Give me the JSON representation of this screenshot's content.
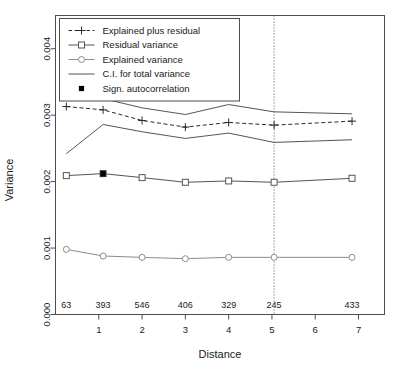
{
  "chart_data": {
    "type": "line",
    "title": "",
    "xlabel": "Distance",
    "ylabel": "Variance",
    "xlim": [
      0,
      7.6
    ],
    "ylim": [
      0.0,
      0.0045
    ],
    "grid": false,
    "legend_position": "top-left",
    "x": [
      0.25,
      1.1,
      2.0,
      3.0,
      4.0,
      5.05,
      6.85
    ],
    "xtick_labels": [
      "1",
      "2",
      "3",
      "4",
      "5",
      "6",
      "7"
    ],
    "xtick_values": [
      1,
      2,
      3,
      4,
      5,
      6,
      7
    ],
    "ytick_labels": [
      "0.000",
      "0.001",
      "0.002",
      "0.003",
      "0.004"
    ],
    "ytick_values": [
      0.0,
      0.001,
      0.002,
      0.003,
      0.004
    ],
    "class_counts": [
      "63",
      "393",
      "546",
      "406",
      "329",
      "245",
      "433"
    ],
    "vline_x": 5.05,
    "series": [
      {
        "name": "Explained plus residual",
        "marker": "plus",
        "linestyle": "dashed",
        "color": "#2a2a2a",
        "values": [
          0.00313,
          0.00308,
          0.00292,
          0.00282,
          0.00289,
          0.00285,
          0.00291
        ]
      },
      {
        "name": "Residual variance",
        "marker": "square-open",
        "linestyle": "solid",
        "color": "#555555",
        "values": [
          0.00209,
          0.00212,
          0.00206,
          0.00199,
          0.00201,
          0.00199,
          0.00205
        ]
      },
      {
        "name": "Explained variance",
        "marker": "circle-open",
        "linestyle": "solid",
        "color": "#8c8c8c",
        "values": [
          0.00098,
          0.00088,
          0.00086,
          0.00084,
          0.00086,
          0.00086,
          0.00086
        ]
      },
      {
        "name": "C.I. for total variance (upper)",
        "marker": "none",
        "linestyle": "solid",
        "color": "#555555",
        "values": [
          0.00395,
          0.00325,
          0.00311,
          0.00301,
          0.00316,
          0.00305,
          0.00302
        ]
      },
      {
        "name": "C.I. for total variance (lower)",
        "marker": "none",
        "linestyle": "solid",
        "color": "#555555",
        "values": [
          0.00242,
          0.00286,
          0.00275,
          0.00265,
          0.00273,
          0.00259,
          0.00263
        ]
      }
    ],
    "significant_points": [
      {
        "x": 1.1,
        "y": 0.00212,
        "series": "Residual variance"
      }
    ],
    "annotations": []
  },
  "legend": {
    "entries": [
      {
        "label": "Explained plus residual",
        "symbol": "plus-dashed"
      },
      {
        "label": "Residual variance",
        "symbol": "square-solid-line"
      },
      {
        "label": "Explained variance",
        "symbol": "circle-solid-line"
      },
      {
        "label": "C.I. for total variance",
        "symbol": "plain-line"
      },
      {
        "label": "Sign. autocorrelation",
        "symbol": "filled-square"
      }
    ]
  },
  "colors": {
    "frame": "#4d4d4d",
    "text": "#1a1a1a",
    "series_dark": "#2a2a2a",
    "series_mid": "#555555",
    "series_light": "#8c8c8c",
    "vline": "#555555",
    "background": "#ffffff"
  }
}
